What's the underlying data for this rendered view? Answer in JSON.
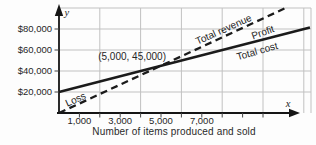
{
  "chart_data": {
    "type": "line",
    "title": "",
    "xlabel": "Number of items produced and sold",
    "ylabel": "",
    "x_axis_symbol": "x",
    "y_axis_symbol": "y",
    "x_ticks": [
      {
        "value": 1000,
        "label": "1,000"
      },
      {
        "value": 3000,
        "label": "3,000"
      },
      {
        "value": 5000,
        "label": "5,000"
      },
      {
        "value": 7000,
        "label": "7,000"
      }
    ],
    "y_ticks": [
      {
        "value": 20000,
        "label": "$20,000"
      },
      {
        "value": 40000,
        "label": "$40,000"
      },
      {
        "value": 60000,
        "label": "$60,000"
      },
      {
        "value": 80000,
        "label": "$80,000"
      }
    ],
    "x_range": [
      0,
      12350
    ],
    "y_range": [
      0,
      100000
    ],
    "grid": {
      "show": true,
      "x_step": 2000,
      "y_step": 20000
    },
    "series": [
      {
        "name": "Total revenue",
        "line_style": "dashed",
        "points": [
          [
            0,
            0
          ],
          [
            11050,
            99450
          ]
        ]
      },
      {
        "name": "Total cost",
        "line_style": "solid",
        "points": [
          [
            0,
            20000
          ],
          [
            12300,
            81500
          ]
        ]
      }
    ],
    "break_even": {
      "x": 5000,
      "y": 45000,
      "label": "(5,000, 45,000)"
    },
    "region_labels": [
      {
        "text": "Loss"
      },
      {
        "text": "Profit"
      }
    ],
    "colors": {
      "line": "#1b1b1b",
      "grid": "#c1c1c1",
      "axis": "#151515",
      "text": "#262626"
    },
    "layout": {
      "legend": "none",
      "origin": [
        59,
        113
      ],
      "x_scale": 0.0204,
      "y_scale": 0.00105,
      "plot_top": 8,
      "plot_right": 311,
      "minor_tick_step": 1000,
      "minor_tick_max": 10000,
      "series_label_pos": [
        {
          "x": 225,
          "y": 32.5,
          "rot": -24
        },
        {
          "x": 258,
          "y": 54.5,
          "rot": -16
        }
      ],
      "region_label_pos": [
        {
          "x": 77,
          "y": 102.5,
          "rot": -24
        },
        {
          "x": 264,
          "y": 35.5,
          "rot": -20
        }
      ],
      "break_even_label_pos": {
        "x": 166,
        "y": 60,
        "anchor": "end"
      }
    }
  }
}
